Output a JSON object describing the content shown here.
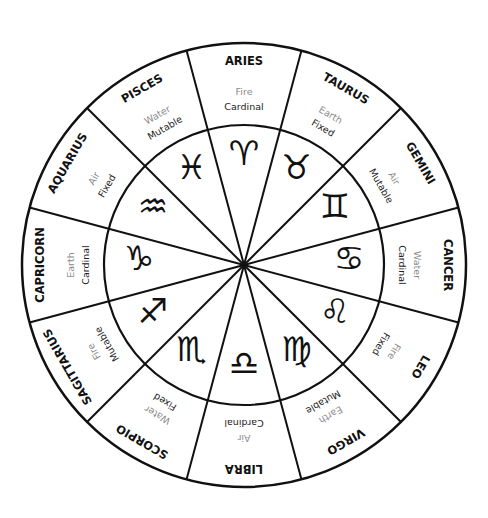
{
  "diagram": {
    "colors": {
      "line": "#111111",
      "name": "#111111",
      "element": "#8a8a8a",
      "modality": "#222222",
      "background": "#ffffff"
    },
    "geometry": {
      "center_x": 244,
      "center_y": 265,
      "outer_radius": 222,
      "inner_radius": 140,
      "sector_degrees": 30
    },
    "signs": [
      {
        "name": "ARIES",
        "element": "Fire",
        "modality": "Cardinal",
        "glyph": "♈",
        "glyph_icon": "aries-glyph-icon"
      },
      {
        "name": "TAURUS",
        "element": "Earth",
        "modality": "Fixed",
        "glyph": "♉",
        "glyph_icon": "taurus-glyph-icon"
      },
      {
        "name": "GEMINI",
        "element": "Air",
        "modality": "Mutable",
        "glyph": "♊",
        "glyph_icon": "gemini-glyph-icon"
      },
      {
        "name": "CANCER",
        "element": "Water",
        "modality": "Cardinal",
        "glyph": "♋",
        "glyph_icon": "cancer-glyph-icon"
      },
      {
        "name": "LEO",
        "element": "Fire",
        "modality": "Fixed",
        "glyph": "♌",
        "glyph_icon": "leo-glyph-icon"
      },
      {
        "name": "VIRGO",
        "element": "Earth",
        "modality": "Mutable",
        "glyph": "♍",
        "glyph_icon": "virgo-glyph-icon"
      },
      {
        "name": "LIBRA",
        "element": "Air",
        "modality": "Cardinal",
        "glyph": "♎",
        "glyph_icon": "libra-glyph-icon"
      },
      {
        "name": "SCORPIO",
        "element": "Water",
        "modality": "Fixed",
        "glyph": "♏",
        "glyph_icon": "scorpio-glyph-icon"
      },
      {
        "name": "SAGITTARIUS",
        "element": "Fire",
        "modality": "Mutable",
        "glyph": "♐",
        "glyph_icon": "sagittarius-glyph-icon"
      },
      {
        "name": "CAPRICORN",
        "element": "Earth",
        "modality": "Cardinal",
        "glyph": "♑",
        "glyph_icon": "capricorn-glyph-icon"
      },
      {
        "name": "AQUARIUS",
        "element": "Air",
        "modality": "Fixed",
        "glyph": "♒",
        "glyph_icon": "aquarius-glyph-icon"
      },
      {
        "name": "PISCES",
        "element": "Water",
        "modality": "Mutable",
        "glyph": "♓",
        "glyph_icon": "pisces-glyph-icon"
      }
    ]
  }
}
